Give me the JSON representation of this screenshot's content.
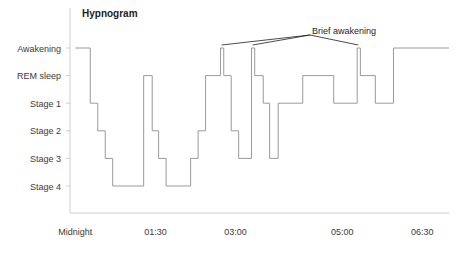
{
  "chart_data": {
    "type": "line",
    "title": "Hypnogram",
    "xlabel": "",
    "ylabel": "",
    "grid": false,
    "legend_position": "none",
    "y_categories": [
      "Awakening",
      "REM sleep",
      "Stage 1",
      "Stage 2",
      "Stage 3",
      "Stage 4"
    ],
    "y_levels": {
      "Awakening": 0,
      "REM sleep": 1,
      "Stage 1": 2,
      "Stage 2": 3,
      "Stage 3": 4,
      "Stage 4": 5
    },
    "x_tick_labels": [
      "Midnight",
      "01:30",
      "03:00",
      "05:00",
      "06:30"
    ],
    "x_tick_hours": [
      0,
      1.5,
      3.0,
      5.0,
      6.5
    ],
    "xlim": [
      -0.1,
      7.0
    ],
    "series": [
      {
        "name": "Sleep stage",
        "step": "post",
        "points": [
          {
            "t": 0.0,
            "stage": "Awakening"
          },
          {
            "t": 0.28,
            "stage": "Stage 1"
          },
          {
            "t": 0.42,
            "stage": "Stage 2"
          },
          {
            "t": 0.56,
            "stage": "Stage 3"
          },
          {
            "t": 0.7,
            "stage": "Stage 4"
          },
          {
            "t": 1.28,
            "stage": "REM sleep"
          },
          {
            "t": 1.44,
            "stage": "Stage 2"
          },
          {
            "t": 1.56,
            "stage": "Stage 3"
          },
          {
            "t": 1.7,
            "stage": "Stage 4"
          },
          {
            "t": 2.16,
            "stage": "Stage 3"
          },
          {
            "t": 2.3,
            "stage": "Stage 2"
          },
          {
            "t": 2.44,
            "stage": "REM sleep"
          },
          {
            "t": 2.72,
            "stage": "Awakening"
          },
          {
            "t": 2.78,
            "stage": "REM sleep"
          },
          {
            "t": 2.92,
            "stage": "Stage 2"
          },
          {
            "t": 3.06,
            "stage": "Stage 3"
          },
          {
            "t": 3.3,
            "stage": "Awakening"
          },
          {
            "t": 3.36,
            "stage": "REM sleep"
          },
          {
            "t": 3.52,
            "stage": "Stage 1"
          },
          {
            "t": 3.64,
            "stage": "Stage 3"
          },
          {
            "t": 3.8,
            "stage": "Stage 1"
          },
          {
            "t": 4.26,
            "stage": "REM sleep"
          },
          {
            "t": 4.84,
            "stage": "Stage 1"
          },
          {
            "t": 5.28,
            "stage": "Awakening"
          },
          {
            "t": 5.34,
            "stage": "REM sleep"
          },
          {
            "t": 5.62,
            "stage": "Stage 1"
          },
          {
            "t": 5.96,
            "stage": "Awakening"
          },
          {
            "t": 7.0,
            "stage": "Awakening"
          }
        ]
      }
    ],
    "annotations": [
      {
        "text": "Brief awakening",
        "points_to_hours": [
          2.74,
          3.32,
          5.3
        ]
      }
    ]
  }
}
